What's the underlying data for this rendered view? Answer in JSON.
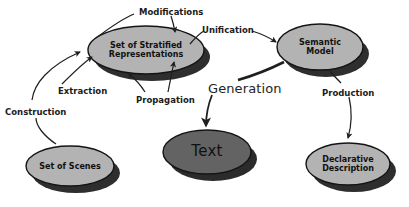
{
  "diagram": {
    "background_color": "#ffffff",
    "node_fill": "#b3b3b3",
    "node_fill_dark": "#636363",
    "node_stroke": "#1a1a1a",
    "shadow_color": "#2b2b2b",
    "edge_color": "#1f1f1f",
    "nodes": [
      {
        "id": "stratified",
        "label_lines": [
          "Set of Stratified",
          "Representations"
        ],
        "line1": "Set of Stratified",
        "line2": "Representations",
        "style": "light",
        "cx": 146,
        "cy": 50,
        "rx": 58,
        "ry": 24
      },
      {
        "id": "semantic",
        "label_lines": [
          "Semantic",
          "Model"
        ],
        "line1": "Semantic",
        "line2": "Model",
        "style": "light",
        "cx": 320,
        "cy": 47,
        "rx": 43,
        "ry": 23
      },
      {
        "id": "scenes",
        "label_lines": [
          "Set of Scenes"
        ],
        "line1": "Set of Scenes",
        "line2": "",
        "style": "light",
        "cx": 70,
        "cy": 166,
        "rx": 44,
        "ry": 20
      },
      {
        "id": "text",
        "label_lines": [
          "Text"
        ],
        "line1": "Text",
        "line2": "",
        "style": "dark",
        "cx": 207,
        "cy": 152,
        "rx": 44,
        "ry": 22
      },
      {
        "id": "declarative",
        "label_lines": [
          "Declarative",
          "Description"
        ],
        "line1": "Declarative",
        "line2": "Description",
        "style": "light",
        "cx": 348,
        "cy": 164,
        "rx": 42,
        "ry": 21
      }
    ],
    "edges": [
      {
        "id": "modifications",
        "label": "Modifications",
        "from": "stratified",
        "to": "stratified",
        "label_x": 139,
        "label_y": 8,
        "size": "small"
      },
      {
        "id": "unification",
        "label": "Unification",
        "from": "stratified",
        "to": "semantic",
        "label_x": 202,
        "label_y": 26,
        "size": "small"
      },
      {
        "id": "extraction",
        "label": "Extraction",
        "from": "scenes",
        "to": "stratified",
        "label_x": 58,
        "label_y": 87,
        "size": "small"
      },
      {
        "id": "propagation",
        "label": "Propagation",
        "from": "stratified",
        "to": "stratified",
        "label_x": 139,
        "label_y": 96,
        "size": "small"
      },
      {
        "id": "construction",
        "label": "Construction",
        "from": "scenes",
        "to": "stratified",
        "label_x": 6,
        "label_y": 108,
        "size": "small"
      },
      {
        "id": "generation",
        "label": "Generation",
        "from": "semantic",
        "to": "text",
        "label_x": 209,
        "label_y": 84,
        "size": "big"
      },
      {
        "id": "production",
        "label": "Production",
        "from": "semantic",
        "to": "declarative",
        "label_x": 322,
        "label_y": 90,
        "size": "small"
      }
    ],
    "footer": {
      "partial_text": ""
    }
  }
}
